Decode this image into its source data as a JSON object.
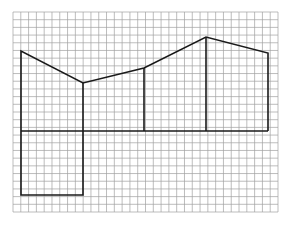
{
  "diagram": {
    "type": "grid-figure",
    "background": "#ffffff",
    "grid": {
      "x0": 13,
      "y0": 12,
      "x1": 278,
      "y1": 212,
      "cols": 34,
      "rows": 26,
      "line_color": "#a0a0a0",
      "line_width": 0.7
    },
    "figure": {
      "stroke": "#1a1a1a",
      "stroke_width": 1.6,
      "polylines": [
        {
          "name": "roof-outline",
          "points": [
            [
              21,
              131
            ],
            [
              21,
              51
            ],
            [
              83,
              83
            ],
            [
              144,
              68
            ],
            [
              206,
              37
            ],
            [
              268,
              53
            ],
            [
              268,
              131
            ]
          ]
        },
        {
          "name": "baseline",
          "points": [
            [
              21,
              131
            ],
            [
              268,
              131
            ]
          ]
        },
        {
          "name": "divider-1",
          "points": [
            [
              83,
              83
            ],
            [
              83,
              131
            ]
          ]
        },
        {
          "name": "divider-2",
          "points": [
            [
              144,
              68
            ],
            [
              144,
              131
            ]
          ]
        },
        {
          "name": "divider-3",
          "points": [
            [
              206,
              37
            ],
            [
              206,
              131
            ]
          ]
        },
        {
          "name": "bottom-rectangle",
          "points": [
            [
              21,
              131
            ],
            [
              21,
              195
            ],
            [
              83,
              195
            ],
            [
              83,
              131
            ]
          ]
        }
      ]
    }
  }
}
